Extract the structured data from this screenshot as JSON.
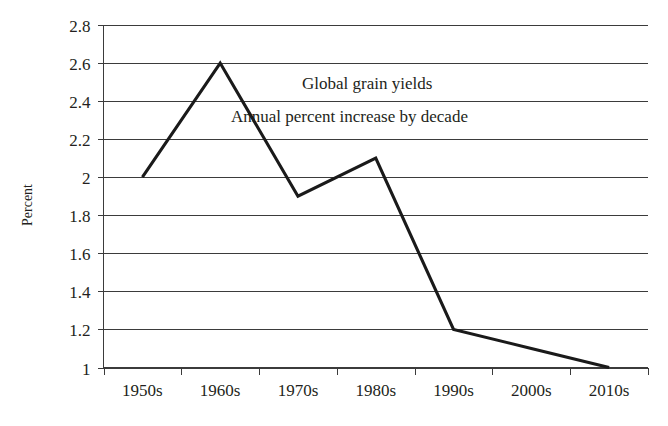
{
  "chart_data": {
    "type": "line",
    "title": "",
    "annotations": [
      "Global grain yields",
      "Annual percent increase by decade"
    ],
    "categories": [
      "1950s",
      "1960s",
      "1970s",
      "1980s",
      "1990s",
      "2000s",
      "2010s"
    ],
    "values": [
      2.0,
      2.6,
      1.9,
      2.1,
      1.2,
      1.1,
      1.0
    ],
    "series": [
      {
        "name": "Annual percent increase by decade",
        "values": [
          2.0,
          2.6,
          1.9,
          2.1,
          1.2,
          1.1,
          1.0
        ],
        "color": "#1a1a1a"
      }
    ],
    "xlabel": "",
    "ylabel": "Percent",
    "ylim": [
      1,
      2.8
    ],
    "ytick_step": 0.2,
    "yticks": [
      "2.8",
      "2.6",
      "2.4",
      "2.2",
      "2",
      "1.8",
      "1.6",
      "1.4",
      "1.2",
      "1"
    ],
    "ytick_values": [
      2.8,
      2.6,
      2.4,
      2.2,
      2.0,
      1.8,
      1.6,
      1.4,
      1.2,
      1.0
    ],
    "grid": "horizontal",
    "legend": "none",
    "background_color": "#ffffff",
    "line_color": "#1a1a1a",
    "grid_color": "#3b3b3b",
    "markers": "none"
  }
}
